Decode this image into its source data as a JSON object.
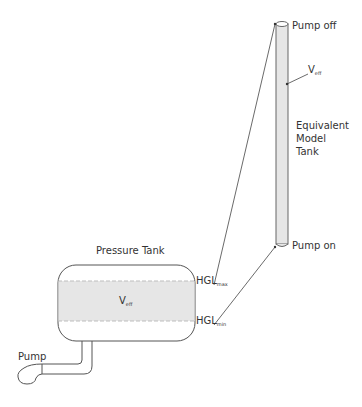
{
  "diagram": {
    "model_tank": {
      "top_label": "Pump off",
      "bottom_label": "Pump on",
      "volume_label": "V",
      "volume_sub": "eff",
      "name_lines": [
        "Equivalent",
        "Model",
        "Tank"
      ]
    },
    "pressure_tank": {
      "title": "Pressure Tank",
      "volume_label": "V",
      "volume_sub": "eff",
      "hgl_max_label": "HGL",
      "hgl_max_sub": "max",
      "hgl_min_label": "HGL",
      "hgl_min_sub": "min"
    },
    "pump": {
      "label": "Pump"
    },
    "colors": {
      "stroke": "#555555",
      "fill_band": "#e6e6e6",
      "dash": "#bdbdbd"
    }
  }
}
